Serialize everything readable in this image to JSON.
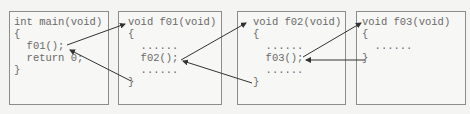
{
  "boxes": [
    {
      "name": "main",
      "lines": [
        "int main(void)",
        "{",
        "  f01();",
        "  return 0;",
        "}"
      ]
    },
    {
      "name": "f01",
      "lines": [
        "void f01(void)",
        "{",
        "  ......",
        "  f02();",
        "  ......",
        "}"
      ]
    },
    {
      "name": "f02",
      "lines": [
        "void f02(void)",
        "{",
        "  ......",
        "  f03();",
        "  ......",
        "}"
      ]
    },
    {
      "name": "f03",
      "lines": [
        "void f03(void)",
        "{",
        "  ......",
        "}"
      ]
    }
  ],
  "arrows": [
    {
      "label": "call f01",
      "from": "main:f01();",
      "to": "f01:header"
    },
    {
      "label": "return from f01",
      "from": "f01:}",
      "to": "main:after f01();"
    },
    {
      "label": "call f02",
      "from": "f01:f02();",
      "to": "f02:header"
    },
    {
      "label": "return from f02",
      "from": "f02:}",
      "to": "f01:after f02();"
    },
    {
      "label": "call f03",
      "from": "f02:f03();",
      "to": "f03:header"
    },
    {
      "label": "return from f03",
      "from": "f03:}",
      "to": "f02:after f03();"
    }
  ],
  "colors": {
    "border": "#8c8c8c",
    "text": "#6a6a6a",
    "arrow": "#333333",
    "background": "#f4f4f2"
  }
}
